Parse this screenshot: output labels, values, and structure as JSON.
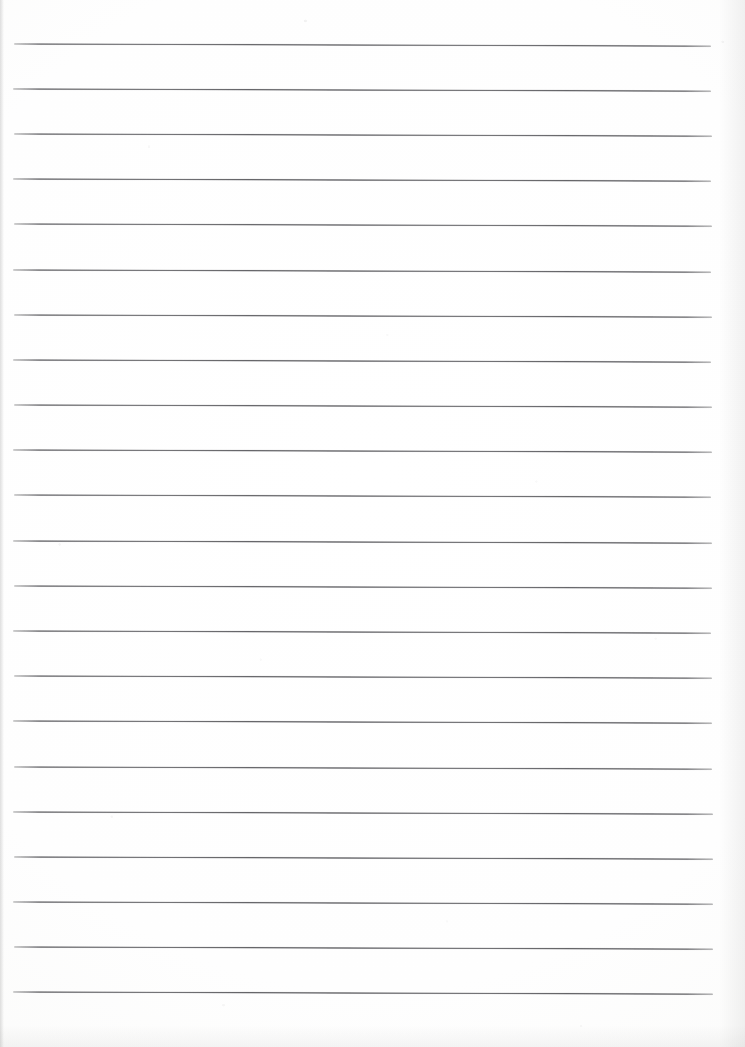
{
  "document": {
    "kind": "scanned-lined-notebook-page",
    "title": "Lined notebook page",
    "page_width": 745,
    "page_height": 1047,
    "background_color": "#fdfdfc",
    "content_text": "",
    "is_blank": true
  },
  "ruling": {
    "line_color": "#4e4e52",
    "line_thickness_px": 2,
    "line_spacing_px": 45.2,
    "first_line_y_px": 43,
    "line_count": 22,
    "left_margin_px": 13,
    "right_edge_px": 712,
    "skew_degrees": 0.18,
    "style": "wide-ruled horizontal"
  },
  "lines": [
    {
      "index": 1,
      "y": 43,
      "x_start": 14,
      "x_end": 711,
      "opacity": 0.92
    },
    {
      "index": 2,
      "y": 88,
      "x_start": 13,
      "x_end": 711,
      "opacity": 0.94
    },
    {
      "index": 3,
      "y": 133,
      "x_start": 14,
      "x_end": 712,
      "opacity": 0.93
    },
    {
      "index": 4,
      "y": 178,
      "x_start": 13,
      "x_end": 711,
      "opacity": 0.95
    },
    {
      "index": 5,
      "y": 223,
      "x_start": 14,
      "x_end": 712,
      "opacity": 0.92
    },
    {
      "index": 6,
      "y": 269,
      "x_start": 13,
      "x_end": 711,
      "opacity": 0.94
    },
    {
      "index": 7,
      "y": 314,
      "x_start": 14,
      "x_end": 712,
      "opacity": 0.93
    },
    {
      "index": 8,
      "y": 359,
      "x_start": 13,
      "x_end": 711,
      "opacity": 0.95
    },
    {
      "index": 9,
      "y": 404,
      "x_start": 14,
      "x_end": 712,
      "opacity": 0.93
    },
    {
      "index": 10,
      "y": 449,
      "x_start": 13,
      "x_end": 712,
      "opacity": 0.94
    },
    {
      "index": 11,
      "y": 494,
      "x_start": 14,
      "x_end": 711,
      "opacity": 0.92
    },
    {
      "index": 12,
      "y": 540,
      "x_start": 13,
      "x_end": 712,
      "opacity": 0.95
    },
    {
      "index": 13,
      "y": 585,
      "x_start": 14,
      "x_end": 712,
      "opacity": 0.93
    },
    {
      "index": 14,
      "y": 630,
      "x_start": 13,
      "x_end": 711,
      "opacity": 0.94
    },
    {
      "index": 15,
      "y": 675,
      "x_start": 14,
      "x_end": 712,
      "opacity": 0.93
    },
    {
      "index": 16,
      "y": 720,
      "x_start": 13,
      "x_end": 712,
      "opacity": 0.95
    },
    {
      "index": 17,
      "y": 766,
      "x_start": 14,
      "x_end": 712,
      "opacity": 0.93
    },
    {
      "index": 18,
      "y": 811,
      "x_start": 13,
      "x_end": 713,
      "opacity": 0.94
    },
    {
      "index": 19,
      "y": 856,
      "x_start": 14,
      "x_end": 713,
      "opacity": 0.95
    },
    {
      "index": 20,
      "y": 901,
      "x_start": 13,
      "x_end": 713,
      "opacity": 0.94
    },
    {
      "index": 21,
      "y": 946,
      "x_start": 14,
      "x_end": 713,
      "opacity": 0.95
    },
    {
      "index": 22,
      "y": 991,
      "x_start": 13,
      "x_end": 713,
      "opacity": 0.95
    }
  ]
}
